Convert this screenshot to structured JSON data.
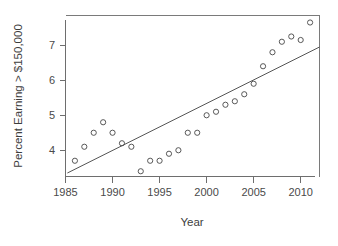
{
  "chart_data": {
    "type": "scatter",
    "title": "",
    "xlabel": "Year",
    "ylabel": "Percent Earning > $150,000",
    "xlim": [
      1985.0,
      2012.0
    ],
    "ylim": [
      3.25,
      7.85
    ],
    "xticks": [
      1985,
      1990,
      1995,
      2000,
      2005,
      2010
    ],
    "xtick_labels": [
      "1985",
      "1990",
      "1995",
      "2000",
      "2005",
      "2010"
    ],
    "yticks": [
      4,
      5,
      6,
      7
    ],
    "ytick_labels": [
      "4",
      "5",
      "6",
      "7"
    ],
    "grid": false,
    "legend": null,
    "point_marker": "open-circle",
    "x": [
      1986,
      1987,
      1988,
      1989,
      1990,
      1991,
      1992,
      1993,
      1994,
      1995,
      1996,
      1997,
      1998,
      1999,
      2000,
      2001,
      2002,
      2003,
      2004,
      2005,
      2006,
      2007,
      2008,
      2009,
      2010,
      2011
    ],
    "values": [
      3.7,
      4.1,
      4.5,
      4.8,
      4.5,
      4.2,
      4.1,
      3.4,
      3.7,
      3.7,
      3.9,
      4.0,
      4.5,
      4.5,
      5.0,
      5.1,
      5.3,
      5.4,
      5.6,
      5.9,
      6.4,
      6.8,
      7.1,
      7.25,
      7.15,
      7.65
    ],
    "series": [
      {
        "name": "Percent earning > $150,000",
        "x": [
          1986,
          1987,
          1988,
          1989,
          1990,
          1991,
          1992,
          1993,
          1994,
          1995,
          1996,
          1997,
          1998,
          1999,
          2000,
          2001,
          2002,
          2003,
          2004,
          2005,
          2006,
          2007,
          2008,
          2009,
          2010,
          2011
        ],
        "values": [
          3.7,
          4.1,
          4.5,
          4.8,
          4.5,
          4.2,
          4.1,
          3.4,
          3.7,
          3.7,
          3.9,
          4.0,
          4.5,
          4.5,
          5.0,
          5.1,
          5.3,
          5.4,
          5.6,
          5.9,
          6.4,
          6.8,
          7.1,
          7.25,
          7.15,
          7.65
        ]
      }
    ],
    "trend_line": {
      "name": "least-squares fit",
      "x_start": 1985.2,
      "y_start": 3.35,
      "x_end": 2012.0,
      "y_end": 6.95
    }
  }
}
